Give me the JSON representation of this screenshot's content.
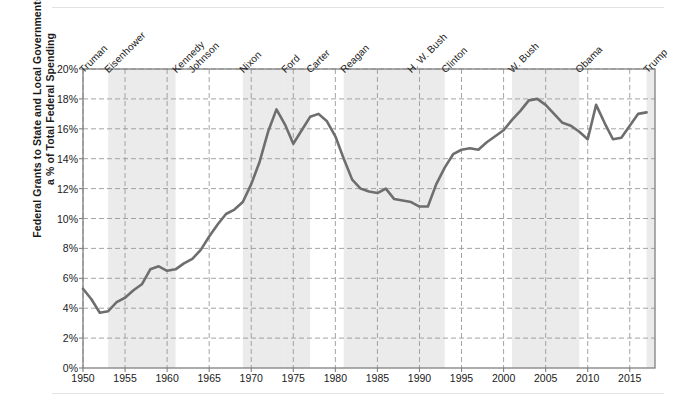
{
  "chart_data": {
    "type": "line",
    "title": "",
    "xlabel": "",
    "ylabel": "Federal Grants to State and Local Governments as a % of Total Federal Spending",
    "ylabel_line1": "Federal Grants to State and Local Governments as",
    "ylabel_line2": "a % of Total Federal Spending",
    "xlim": [
      1950,
      2017
    ],
    "ylim": [
      0,
      20
    ],
    "ytick_values": [
      0,
      2,
      4,
      6,
      8,
      10,
      12,
      14,
      16,
      18,
      20
    ],
    "ytick_labels": [
      "0%",
      "2%",
      "4%",
      "6%",
      "8%",
      "10%",
      "12%",
      "14%",
      "16%",
      "18%",
      "20%"
    ],
    "xtick_values": [
      1950,
      1955,
      1960,
      1965,
      1970,
      1975,
      1980,
      1985,
      1990,
      1995,
      2000,
      2005,
      2010,
      2015
    ],
    "xtick_labels": [
      "1950",
      "1955",
      "1960",
      "1965",
      "1970",
      "1975",
      "1980",
      "1985",
      "1990",
      "1995",
      "2000",
      "2005",
      "2010",
      "2015"
    ],
    "grid": true,
    "grid_style": "dashed",
    "legend": "none",
    "line_color": "#6e6e6e",
    "line_width": 2.6,
    "band_color": "#ebebeb",
    "x": [
      1950,
      1951,
      1952,
      1953,
      1954,
      1955,
      1956,
      1957,
      1958,
      1959,
      1960,
      1961,
      1962,
      1963,
      1964,
      1965,
      1966,
      1967,
      1968,
      1969,
      1970,
      1971,
      1972,
      1973,
      1974,
      1975,
      1976,
      1977,
      1978,
      1979,
      1980,
      1981,
      1982,
      1983,
      1984,
      1985,
      1986,
      1987,
      1988,
      1989,
      1990,
      1991,
      1992,
      1993,
      1994,
      1995,
      1996,
      1997,
      1998,
      1999,
      2000,
      2001,
      2002,
      2003,
      2004,
      2005,
      2006,
      2007,
      2008,
      2009,
      2010,
      2011,
      2012,
      2013,
      2014,
      2015,
      2016,
      2017
    ],
    "values": [
      5.3,
      4.6,
      3.7,
      3.8,
      4.4,
      4.7,
      5.2,
      5.6,
      6.6,
      6.8,
      6.5,
      6.6,
      7.0,
      7.3,
      7.9,
      8.8,
      9.6,
      10.3,
      10.6,
      11.1,
      12.3,
      13.8,
      15.8,
      17.3,
      16.3,
      15.0,
      15.9,
      16.8,
      17.0,
      16.5,
      15.5,
      14.0,
      12.6,
      12.0,
      11.8,
      11.7,
      12.0,
      11.3,
      11.2,
      11.1,
      10.8,
      10.8,
      12.3,
      13.4,
      14.3,
      14.6,
      14.7,
      14.6,
      15.1,
      15.5,
      15.9,
      16.6,
      17.2,
      17.9,
      18.0,
      17.6,
      17.0,
      16.4,
      16.2,
      15.8,
      15.3,
      17.6,
      16.4,
      15.3,
      15.4,
      16.2,
      17.0,
      17.1
    ],
    "bands": [
      {
        "label": "Truman",
        "start": 1950,
        "end": 1953,
        "shaded": false
      },
      {
        "label": "Eisenhower",
        "start": 1953,
        "end": 1961,
        "shaded": true
      },
      {
        "label": "Kennedy",
        "start": 1961,
        "end": 1963,
        "shaded": false
      },
      {
        "label": "Johnson",
        "start": 1963,
        "end": 1969,
        "shaded": false
      },
      {
        "label": "Nixon",
        "start": 1969,
        "end": 1974,
        "shaded": true
      },
      {
        "label": "Ford",
        "start": 1974,
        "end": 1977,
        "shaded": true
      },
      {
        "label": "Carter",
        "start": 1977,
        "end": 1981,
        "shaded": false
      },
      {
        "label": "Reagan",
        "start": 1981,
        "end": 1989,
        "shaded": true
      },
      {
        "label": "H. W. Bush",
        "start": 1989,
        "end": 1993,
        "shaded": true
      },
      {
        "label": "Clinton",
        "start": 1993,
        "end": 2001,
        "shaded": false
      },
      {
        "label": "W. Bush",
        "start": 2001,
        "end": 2009,
        "shaded": true
      },
      {
        "label": "Obama",
        "start": 2009,
        "end": 2017,
        "shaded": false
      },
      {
        "label": "Trump",
        "start": 2017,
        "end": 2018,
        "shaded": true
      }
    ],
    "president_labels": [
      "Truman",
      "Eisenhower",
      "Kennedy",
      "Johnson",
      "Nixon",
      "Ford",
      "Carter",
      "Reagan",
      "H. W. Bush",
      "Clinton",
      "W. Bush",
      "Obama",
      "Trump"
    ]
  }
}
